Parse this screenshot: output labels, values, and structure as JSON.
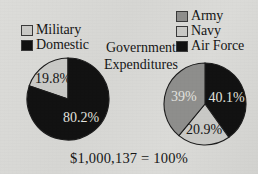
{
  "figure": {
    "center_caption_line1": "Government",
    "center_caption_line2": "Expenditures",
    "total_caption": "$1,000,137 = 100%",
    "background_color": "#d9d9d6"
  },
  "legend_left": {
    "items": [
      {
        "label": "Military",
        "swatch": "light",
        "color": "#c9c9c6"
      },
      {
        "label": "Domestic",
        "swatch": "black",
        "color": "#121212"
      }
    ]
  },
  "legend_right": {
    "items": [
      {
        "label": "Army",
        "swatch": "gray",
        "color": "#8e8e8c"
      },
      {
        "label": "Navy",
        "swatch": "light",
        "color": "#c9c9c6"
      },
      {
        "label": "Air Force",
        "swatch": "black",
        "color": "#121212"
      }
    ]
  },
  "chart_data": [
    {
      "type": "pie",
      "title": "Government Expenditures",
      "name": "expenditure-split",
      "categories": [
        "Military",
        "Domestic"
      ],
      "values": [
        19.8,
        80.2
      ],
      "labels": [
        "19.8%",
        "80.2%"
      ],
      "colors": [
        "#c9c9c6",
        "#121212"
      ],
      "label_colors": [
        "dark",
        "light"
      ],
      "start_angle_deg": 0,
      "direction": "counterclockwise",
      "units": "percent",
      "total": "$1,000,137 = 100%",
      "legend_position": "top-left"
    },
    {
      "type": "pie",
      "title": "Government Expenditures",
      "name": "military-branch-split",
      "categories": [
        "Air Force",
        "Navy",
        "Army"
      ],
      "values": [
        40.1,
        20.9,
        39.0
      ],
      "labels": [
        "40.1%",
        "20.9%",
        "39%"
      ],
      "colors": [
        "#121212",
        "#c9c9c6",
        "#8e8e8c"
      ],
      "label_colors": [
        "light",
        "dark",
        "light"
      ],
      "start_angle_deg": 0,
      "direction": "clockwise",
      "units": "percent",
      "legend_position": "top-right"
    }
  ]
}
